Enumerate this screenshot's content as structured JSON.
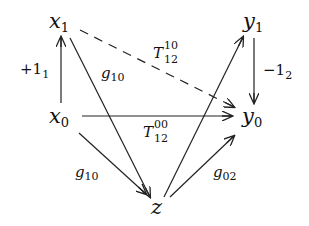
{
  "diagram": {
    "nodes": {
      "x1": {
        "base": "x",
        "sub": "1"
      },
      "y1": {
        "base": "y",
        "sub": "1"
      },
      "x0": {
        "base": "x",
        "sub": "0"
      },
      "y0": {
        "base": "y",
        "sub": "0"
      },
      "z": {
        "base": "z"
      }
    },
    "edges": [
      {
        "from": "x0",
        "to": "x1",
        "label": {
          "base": "+1",
          "sub": "1"
        },
        "style": "solid"
      },
      {
        "from": "y1",
        "to": "y0",
        "label": {
          "base": "−1",
          "sub": "2"
        },
        "style": "solid"
      },
      {
        "from": "x1",
        "to": "y0",
        "label": {
          "base": "T",
          "sub": "12",
          "sup": "10"
        },
        "style": "dashed"
      },
      {
        "from": "x0",
        "to": "y0",
        "label": {
          "base": "T",
          "sub": "12",
          "sup": "00"
        },
        "style": "solid"
      },
      {
        "from": "x1",
        "to": "z",
        "label": {
          "base": "g",
          "sub": "10"
        },
        "style": "solid"
      },
      {
        "from": "x0",
        "to": "z",
        "label": {
          "base": "g",
          "sub": "10"
        },
        "style": "solid"
      },
      {
        "from": "z",
        "to": "y1",
        "label": null,
        "style": "solid"
      },
      {
        "from": "z",
        "to": "y0",
        "label": {
          "base": "g",
          "sub": "02"
        },
        "style": "solid"
      }
    ]
  }
}
